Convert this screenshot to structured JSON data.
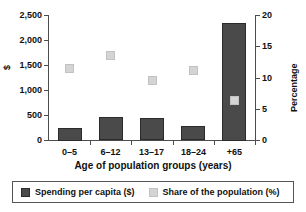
{
  "chart_data": {
    "type": "bar",
    "title": "",
    "subtitle": "",
    "xlabel": "Age of population groups (years)",
    "ylabel": "$",
    "y2label": "Percentage",
    "categories": [
      "0–5",
      "6–12",
      "13–17",
      "18–24",
      "+65"
    ],
    "ylim": [
      0,
      2500
    ],
    "y2lim": [
      0,
      20
    ],
    "yticks": [
      "0",
      "500",
      "1,000",
      "1,500",
      "2,000",
      "2,500"
    ],
    "ytick_values": [
      0,
      500,
      1000,
      1500,
      2000,
      2500
    ],
    "y2ticks": [
      "0",
      "5",
      "10",
      "15",
      "20"
    ],
    "y2tick_values": [
      0,
      5,
      10,
      15,
      20
    ],
    "grid": false,
    "legend_position": "bottom",
    "series": [
      {
        "name": "Spending per capita ($)",
        "type": "bar",
        "axis": "left",
        "color": "#4a4a4a",
        "values": [
          250,
          460,
          440,
          280,
          2350
        ]
      },
      {
        "name": "Share of the population (%)",
        "type": "scatter",
        "axis": "right",
        "color": "#d4d4d4",
        "values": [
          11.5,
          13.6,
          9.6,
          11.2,
          6.3
        ]
      }
    ]
  },
  "legend": {
    "entries": [
      {
        "label": "Spending per capita ($)",
        "color": "#4a4a4a"
      },
      {
        "label": "Share of the population (%)",
        "color": "#d4d4d4"
      }
    ]
  }
}
